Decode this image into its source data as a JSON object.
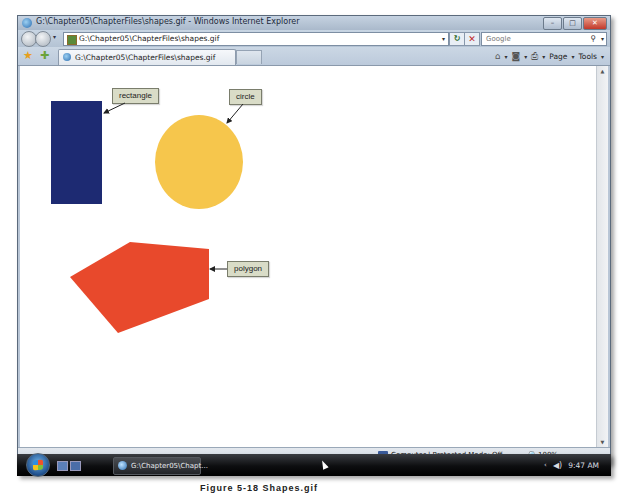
{
  "window": {
    "title": "G:\\Chapter05\\ChapterFiles\\shapes.gif - Windows Internet Explorer",
    "controls": {
      "minimize": "–",
      "maximize": "□",
      "close": "✕"
    }
  },
  "navigation": {
    "address": "G:\\Chapter05\\ChapterFiles\\shapes.gif",
    "refresh_glyph": "↻",
    "stop_glyph": "✕",
    "search_placeholder": "Google",
    "search_glyph": "⚲",
    "dropdown_glyph": "▾"
  },
  "tabs": [
    {
      "label": "G:\\Chapter05\\ChapterFiles\\shapes.gif",
      "active": true
    }
  ],
  "command_bar": {
    "home_glyph": "⌂",
    "feeds_glyph": "◙",
    "print_glyph": "⎙",
    "page_label": "Page",
    "tools_label": "Tools",
    "dropdown_glyph": "▾"
  },
  "content": {
    "shapes": [
      {
        "type": "rectangle",
        "label": "rectangle",
        "color": "#1d2a72"
      },
      {
        "type": "circle",
        "label": "circle",
        "color": "#f6c64c"
      },
      {
        "type": "polygon",
        "label": "polygon",
        "color": "#e8492c"
      }
    ]
  },
  "status_bar": {
    "zone": "Computer | Protected Mode: Off",
    "zoom_glyph": "🔍",
    "zoom": "100%",
    "dropdown_glyph": "▾"
  },
  "taskbar": {
    "task_label": "G:\\Chapter05\\Chapt...",
    "tray_chevron": "‹",
    "volume_glyph": "◀)",
    "clock": "9:47 AM"
  },
  "caption": "Figure 5-18  Shapes.gif"
}
